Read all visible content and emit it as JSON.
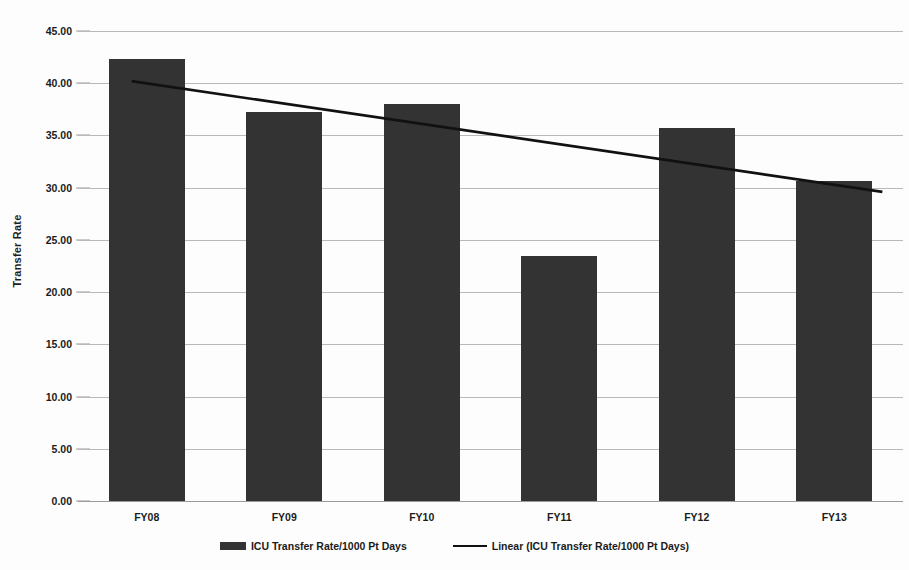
{
  "chart_data": {
    "type": "bar",
    "title": "",
    "subtitle": "",
    "xlabel": "",
    "ylabel": "Transfer Rate",
    "categories": [
      "FY08",
      "FY09",
      "FY10",
      "FY11",
      "FY12",
      "FY13"
    ],
    "series": [
      {
        "name": "ICU Transfer Rate/1000 Pt Days",
        "type": "bar",
        "color": "#333333",
        "values": [
          42.3,
          37.2,
          38.0,
          23.5,
          35.7,
          30.65
        ]
      },
      {
        "name": "Linear (ICU Transfer Rate/1000 Pt Days)",
        "type": "line",
        "color": "#111111",
        "trendline": true,
        "endpoints": [
          40.2,
          29.6
        ]
      }
    ],
    "ylim": [
      0,
      45
    ],
    "ytick_step": 5,
    "ytick_labels": [
      "45.00",
      "40.00",
      "35.00",
      "30.00",
      "25.00",
      "20.00",
      "15.00",
      "10.00",
      "5.00",
      "0.00"
    ],
    "ytick_values": [
      45,
      40,
      35,
      30,
      25,
      20,
      15,
      10,
      5,
      0
    ],
    "grid": true,
    "grid_color": "#b9b9b9",
    "legend_position": "bottom",
    "background": "#ffffff"
  },
  "legend": {
    "items": [
      {
        "label": "ICU Transfer Rate/1000 Pt Days",
        "marker": "bar-swatch"
      },
      {
        "label": "Linear (ICU Transfer Rate/1000 Pt Days)",
        "marker": "line-swatch"
      }
    ]
  }
}
